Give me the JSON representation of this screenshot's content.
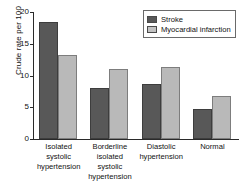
{
  "chart_data": {
    "type": "bar",
    "title": "",
    "xlabel": "",
    "ylabel": "Crude rate per 100",
    "ylim": [
      0,
      20
    ],
    "yticks": [
      "0",
      "5",
      "10",
      "15",
      "20"
    ],
    "grid": false,
    "legend_position": "top-right",
    "categories": [
      "Isolated systolic hypertension",
      "Borderline isolated systolic hypertension",
      "Diastolic hypertension",
      "Normal"
    ],
    "category_lines": [
      [
        "Isolated",
        "systolic",
        "hypertension"
      ],
      [
        "Borderline",
        "isolated",
        "systolic",
        "hypertension"
      ],
      [
        "Diastolic",
        "hypertension"
      ],
      [
        "Normal"
      ]
    ],
    "series": [
      {
        "name": "Stroke",
        "color": "#585858",
        "values": [
          18.4,
          8.0,
          8.6,
          4.8
        ]
      },
      {
        "name": "Myocardial infarction",
        "color": "#b9b9b9",
        "values": [
          13.3,
          11.1,
          11.4,
          6.7
        ]
      }
    ]
  },
  "legend": {
    "items": [
      {
        "label": "Stroke"
      },
      {
        "label": "Myocardial infarction"
      }
    ]
  }
}
